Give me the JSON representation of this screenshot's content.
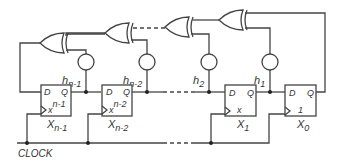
{
  "diagram": {
    "clock_label": "CLOCK",
    "colors": {
      "line": "#444444",
      "text": "#333333",
      "background": "#ffffff"
    },
    "pin_labels": {
      "d": "D",
      "q": "Q"
    },
    "flip_flops": [
      {
        "name": "X",
        "sub": "n-1",
        "inner": "x",
        "inner_sup": "n-1"
      },
      {
        "name": "X",
        "sub": "n-2",
        "inner": "x",
        "inner_sup": "n-2"
      },
      {
        "name": "X",
        "sub": "1",
        "inner": "x",
        "inner_sup": ""
      },
      {
        "name": "X",
        "sub": "0",
        "inner": "1",
        "inner_sup": ""
      }
    ],
    "taps": [
      {
        "name": "h",
        "sub": "n-1"
      },
      {
        "name": "h",
        "sub": "n-2"
      },
      {
        "name": "h",
        "sub": "2"
      },
      {
        "name": "h",
        "sub": "1"
      }
    ],
    "xor_gates": 4
  }
}
